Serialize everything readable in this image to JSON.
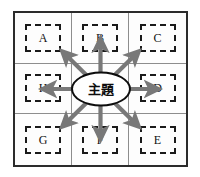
{
  "diagram": {
    "type": "radial-matrix",
    "title_visible": false,
    "center": {
      "label": "主題",
      "shape": "ellipse",
      "border_color": "#0d0d0d",
      "fill_color": "#ffffff"
    },
    "frame": {
      "border_color": "#2b2b2b",
      "gridline_color": "#8d8d8d",
      "background_color": "#fdfdfd",
      "rows": 3,
      "columns": 3
    },
    "branch_style": {
      "border_style": "dashed",
      "border_color": "#1a1a1a"
    },
    "arrows": {
      "color": "#787878",
      "count": 8,
      "directions": [
        "up-left",
        "up",
        "up-right",
        "right",
        "down-right",
        "down",
        "down-left",
        "left"
      ]
    },
    "cells": [
      {
        "position": "top-left",
        "label": "A",
        "is_center": false
      },
      {
        "position": "top-center",
        "label": "B",
        "is_center": false
      },
      {
        "position": "top-right",
        "label": "C",
        "is_center": false
      },
      {
        "position": "middle-left",
        "label": "H",
        "is_center": false
      },
      {
        "position": "middle-center",
        "label": "",
        "is_center": true
      },
      {
        "position": "middle-right",
        "label": "D",
        "is_center": false
      },
      {
        "position": "bottom-left",
        "label": "G",
        "is_center": false
      },
      {
        "position": "bottom-center",
        "label": "F",
        "is_center": false
      },
      {
        "position": "bottom-right",
        "label": "E",
        "is_center": false
      }
    ]
  }
}
